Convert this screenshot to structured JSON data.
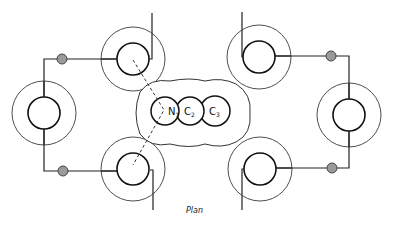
{
  "figure": {
    "caption": "Plan",
    "colors": {
      "line": "#222222",
      "dot_fill": "#9a9a9a",
      "background": "#ffffff"
    }
  },
  "molecule": {
    "atoms": [
      {
        "symbol": "N",
        "subscript": "1"
      },
      {
        "symbol": "C",
        "subscript": "2"
      },
      {
        "symbol": "C",
        "subscript": "3"
      }
    ]
  },
  "rings": [
    {
      "id": "top-left"
    },
    {
      "id": "left"
    },
    {
      "id": "bottom-left"
    },
    {
      "id": "top-right"
    },
    {
      "id": "right"
    },
    {
      "id": "bottom-right"
    }
  ],
  "connectors": {
    "count": 4,
    "icon": "hatched-dot-icon"
  }
}
